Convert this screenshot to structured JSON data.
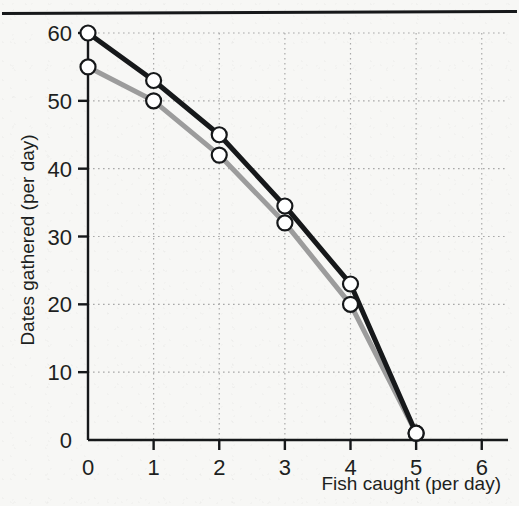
{
  "figure": {
    "background_color": "#f7f7f5",
    "rule_color": "#16181a"
  },
  "chart_data": {
    "type": "line",
    "title": "",
    "subtitle": "",
    "xlabel": "Fish caught (per day)",
    "ylabel": "Dates gathered (per day)",
    "xlim": [
      0,
      6.4
    ],
    "ylim": [
      0,
      62
    ],
    "xticks": [
      0,
      1,
      2,
      3,
      4,
      5,
      6
    ],
    "xtick_labels": [
      "0",
      "1",
      "2",
      "3",
      "4",
      "5",
      "6"
    ],
    "yticks": [
      0,
      10,
      20,
      30,
      40,
      50,
      60
    ],
    "ytick_labels": [
      "0",
      "10",
      "20",
      "30",
      "40",
      "50",
      "60"
    ],
    "grid": true,
    "grid_style": "dotted",
    "grid_color": "#a9a9a9",
    "legend": false,
    "legend_position": "none",
    "marker": "open-circle",
    "x": [
      0,
      1,
      2,
      3,
      4,
      5
    ],
    "series": [
      {
        "name": "black-curve",
        "color": "#16181a",
        "line_width": 5,
        "values": [
          60,
          53,
          45,
          34.5,
          23,
          1
        ]
      },
      {
        "name": "gray-curve",
        "color": "#9c9c9c",
        "line_width": 5,
        "values": [
          55,
          50,
          42,
          32,
          20,
          1
        ]
      }
    ],
    "annotations": []
  }
}
